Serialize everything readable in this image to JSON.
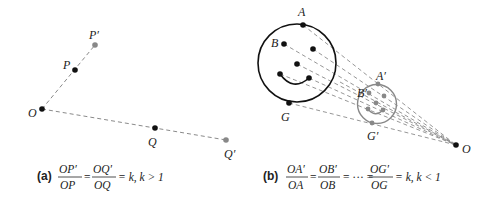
{
  "panel_a": {
    "points": {
      "O": {
        "label": "O",
        "x": 42,
        "y": 109,
        "color": "#111111"
      },
      "P": {
        "label": "P",
        "x": 75,
        "y": 70,
        "color": "#111111"
      },
      "P_prime": {
        "label": "P′",
        "x": 95,
        "y": 45,
        "color": "#888888"
      },
      "Q": {
        "label": "Q",
        "x": 155,
        "y": 128,
        "color": "#111111"
      },
      "Q_prime": {
        "label": "Q′",
        "x": 226,
        "y": 140,
        "color": "#888888"
      }
    },
    "caption": {
      "tag": "(a)",
      "frac1_num": "OP′",
      "frac1_den": "OP",
      "frac2_num": "OQ′",
      "frac2_den": "OQ",
      "tail": "= k, k > 1"
    }
  },
  "panel_b": {
    "points": {
      "A": {
        "label": "A"
      },
      "B": {
        "label": "B"
      },
      "G": {
        "label": "G"
      },
      "A_prime": {
        "label": "A′"
      },
      "B_prime": {
        "label": "B′"
      },
      "G_prime": {
        "label": "G′"
      },
      "O": {
        "label": "O"
      }
    },
    "caption": {
      "tag": "(b)",
      "frac1_num": "OA′",
      "frac1_den": "OA",
      "frac2_num": "OB′",
      "frac2_den": "OB",
      "ellipsis": "= ··· =",
      "frac3_num": "OG′",
      "frac3_den": "OG",
      "tail": "= k, k < 1"
    }
  },
  "colors": {
    "original": "#111111",
    "image": "#888888",
    "dashed_line": "#8a8a8a"
  }
}
